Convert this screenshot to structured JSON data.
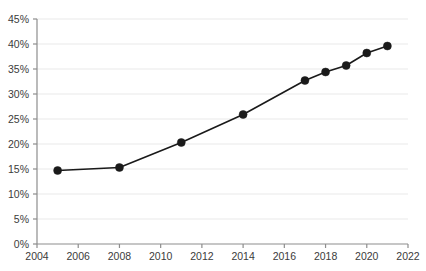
{
  "chart_data": {
    "type": "line",
    "title": "",
    "subtitle": "",
    "xlabel": "",
    "ylabel": "",
    "x": [
      2005,
      2008,
      2011,
      2014,
      2017,
      2018,
      2019,
      2020,
      2021
    ],
    "values": [
      14.7,
      15.3,
      20.3,
      25.9,
      32.7,
      34.4,
      35.7,
      38.2,
      39.6
    ],
    "point_labels": [
      "14.7%",
      "15.3%",
      "20.3%",
      "25.9%",
      "32.7%",
      "34.4%",
      "35.7%",
      "38.2%",
      "39.6%"
    ],
    "series": [
      {
        "name": "",
        "x": [
          2005,
          2008,
          2011,
          2014,
          2017,
          2018,
          2019,
          2020,
          2021
        ],
        "values": [
          14.7,
          15.3,
          20.3,
          25.9,
          32.7,
          34.4,
          35.7,
          38.2,
          39.6
        ]
      }
    ],
    "xlim": [
      2004,
      2022
    ],
    "ylim": [
      0,
      45
    ],
    "ytick_values": [
      0,
      5,
      10,
      15,
      20,
      25,
      30,
      35,
      40,
      45
    ],
    "ytick_labels": [
      "0%",
      "5%",
      "10%",
      "15%",
      "20%",
      "25%",
      "30%",
      "35%",
      "40%",
      "45%"
    ],
    "xtick_values": [
      2004,
      2006,
      2008,
      2010,
      2012,
      2014,
      2016,
      2018,
      2020,
      2022
    ],
    "xtick_labels": [
      "2004",
      "2006",
      "2008",
      "2010",
      "2012",
      "2014",
      "2016",
      "2018",
      "2020",
      "2022"
    ],
    "grid": {
      "horizontal": true,
      "vertical": false,
      "color": "#e9e9e9"
    },
    "legend": {
      "visible": false,
      "position": "none",
      "entries": []
    },
    "style": {
      "line_color": "#1a1a1a",
      "marker_color": "#1a1a1a",
      "marker_shape": "circle",
      "marker_radius": 4,
      "line_width": 1.6,
      "axis_color": "#8d8d8d",
      "tick_label_color": "#3b3b3b",
      "background": "#ffffff"
    }
  }
}
